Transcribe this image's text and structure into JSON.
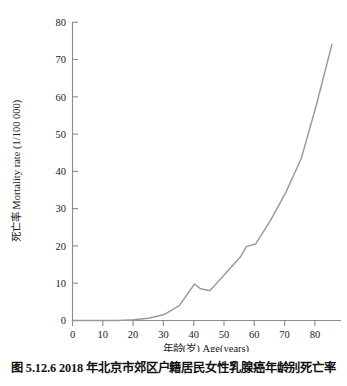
{
  "caption": "图 5.12.6  2018 年北京市郊区户籍居民女性乳腺癌年龄别死亡率",
  "chart_data": {
    "type": "line",
    "title": "",
    "xlabel": "年龄(岁) Age(years)",
    "ylabel": "死亡率 Mortality rate (1/100 000)",
    "xlim": [
      0,
      88
    ],
    "ylim": [
      0,
      80
    ],
    "xticks": [
      0,
      10,
      20,
      30,
      40,
      50,
      60,
      70,
      80
    ],
    "yticks": [
      0,
      10,
      20,
      30,
      40,
      50,
      60,
      70,
      80
    ],
    "xtick_labels": [
      "0",
      "10",
      "20",
      "30",
      "40",
      "50",
      "60",
      "70",
      "80"
    ],
    "ytick_labels": [
      "0",
      "10",
      "20",
      "30",
      "40",
      "50",
      "60",
      "70",
      "80"
    ],
    "grid": false,
    "legend": false,
    "legend_position": "none",
    "line_color": "#9a9a9a",
    "axis_color": "#8c8c8c",
    "series": [
      {
        "name": "死亡率 Mortality rate (1/100 000)",
        "x": [
          0,
          5,
          10,
          15,
          20,
          25,
          30,
          35,
          40,
          42,
          45,
          50,
          55,
          57,
          60,
          65,
          70,
          75,
          80,
          85
        ],
        "values": [
          0,
          0,
          0,
          0,
          0.2,
          0.6,
          1.6,
          4.0,
          9.8,
          8.5,
          8.0,
          12.5,
          17.0,
          19.8,
          20.5,
          27.0,
          34.5,
          43.5,
          58.0,
          74.0
        ]
      }
    ]
  }
}
